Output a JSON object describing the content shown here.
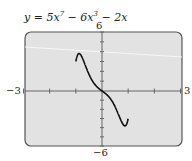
{
  "chart_data": {
    "type": "line",
    "title_parts": {
      "lead": "y = 5x",
      "exp1": "7",
      "mid": " − 6x",
      "exp2": "3",
      "tail": " − 2x"
    },
    "xlabel": "",
    "ylabel": "",
    "xlim": [
      -3,
      3
    ],
    "ylim": [
      -6,
      6
    ],
    "x_tick_labels": {
      "min": "−3",
      "max": "3"
    },
    "y_tick_labels": {
      "min": "−6",
      "max": "6"
    },
    "x_ticks": [
      -3,
      -2,
      -1,
      0,
      1,
      2,
      3
    ],
    "y_ticks": [
      -6,
      -5,
      -4,
      -3,
      -2,
      -1,
      0,
      1,
      2,
      3,
      4,
      5,
      6
    ],
    "grid": false,
    "series": [
      {
        "name": "y = 5x^7 − 6x^3 − 2x",
        "function": "5*x^7 - 6*x^3 - 2*x",
        "x": [
          -0.97,
          -0.95,
          -0.9,
          -0.85,
          -0.8,
          -0.75,
          -0.7,
          -0.6,
          -0.5,
          -0.4,
          -0.3,
          -0.2,
          -0.1,
          0,
          0.1,
          0.2,
          0.3,
          0.4,
          0.5,
          0.6,
          0.7,
          0.75,
          0.8,
          0.85,
          0.9,
          0.95,
          0.97
        ],
        "y": [
          -6.0,
          -4.18,
          -0.74,
          1.56,
          2.55,
          2.68,
          2.3,
          1.62,
          1.71,
          1.11,
          0.76,
          0.45,
          0.21,
          0,
          -0.21,
          -0.45,
          -0.76,
          -1.11,
          -1.71,
          -1.62,
          -2.3,
          -2.68,
          -2.55,
          -1.56,
          0.74,
          4.18,
          6.0
        ]
      }
    ],
    "colors": {
      "plot_bg": "#e2e2e2",
      "frame": "#555555",
      "axis": "#666666",
      "curve": "#111111",
      "stray_line": "#f5f5f5"
    }
  }
}
